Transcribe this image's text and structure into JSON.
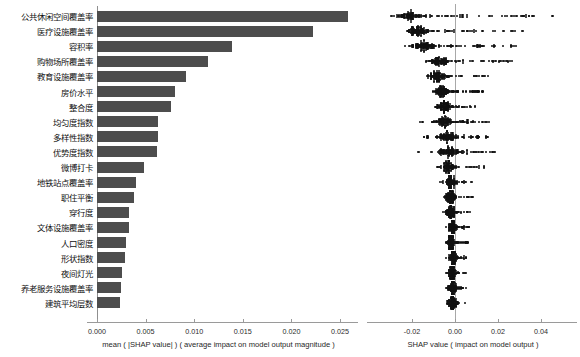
{
  "figure": {
    "type": "shap-summary",
    "background": "#ffffff",
    "bar_color": "#4d4d4d",
    "dot_color": "#111111",
    "axis_color": "#9a9a9a"
  },
  "chart_data": [
    {
      "type": "bar",
      "orientation": "horizontal",
      "title": "",
      "xlabel": "mean ( |SHAP value| ) ( average impact on model output magnitude )",
      "ylabel": "",
      "xlim": [
        0.0,
        0.027
      ],
      "xticks": [
        0.0,
        0.005,
        0.01,
        0.015,
        0.02,
        0.025
      ],
      "xticklabels": [
        "0.000",
        "0.005",
        "0.010",
        "0.015",
        "0.020",
        "0.025"
      ],
      "grid": false,
      "legend": "none",
      "categories": [
        "公共休闲空间覆盖率",
        "医疗设施覆盖率",
        "容积率",
        "购物场所覆盖率",
        "教育设施覆盖率",
        "房价水平",
        "整合度",
        "均匀度指数",
        "多样性指数",
        "优势度指数",
        "微博打卡",
        "地铁站点覆盖率",
        "职住平衡",
        "穿行度",
        "文体设施覆盖率",
        "人口密度",
        "形状指数",
        "夜间灯光",
        "养老服务设施覆盖率",
        "建筑平均层数"
      ],
      "values": [
        0.0258,
        0.0222,
        0.0139,
        0.0114,
        0.0092,
        0.008,
        0.0076,
        0.0063,
        0.0063,
        0.0062,
        0.0048,
        0.004,
        0.0038,
        0.0033,
        0.0033,
        0.003,
        0.0029,
        0.0026,
        0.0025,
        0.0024
      ]
    },
    {
      "type": "scatter",
      "subtype": "beeswarm",
      "title": "",
      "xlabel": "SHAP value ( impact on model output )",
      "ylabel": "",
      "xlim": [
        -0.031,
        0.056
      ],
      "xticks": [
        -0.02,
        0.0,
        0.02,
        0.04
      ],
      "xticklabels": [
        "-0.02",
        "0.00",
        "0.02",
        "0.04"
      ],
      "grid": false,
      "legend": "none",
      "zero_reference_line": 0.0,
      "categories": [
        "公共休闲空间覆盖率",
        "医疗设施覆盖率",
        "容积率",
        "购物场所覆盖率",
        "教育设施覆盖率",
        "房价水平",
        "整合度",
        "均匀度指数",
        "多样性指数",
        "优势度指数",
        "微博打卡",
        "地铁站点覆盖率",
        "职住平衡",
        "穿行度",
        "文体设施覆盖率",
        "人口密度",
        "形状指数",
        "夜间灯光",
        "养老服务设施覆盖率",
        "建筑平均层数"
      ],
      "series": [
        {
          "name": "公共休闲空间覆盖率",
          "cluster_center": -0.0205,
          "cluster_spread": 0.0055,
          "tail_max": 0.0465,
          "tail_min": -0.0275,
          "n_points": 150,
          "tail_density": 0.52
        },
        {
          "name": "医疗设施覆盖率",
          "cluster_center": -0.0175,
          "cluster_spread": 0.0042,
          "tail_max": 0.0365,
          "tail_min": -0.0235,
          "n_points": 145,
          "tail_density": 0.45
        },
        {
          "name": "容积率",
          "cluster_center": -0.0145,
          "cluster_spread": 0.005,
          "tail_max": 0.0305,
          "tail_min": -0.0215,
          "n_points": 140,
          "tail_density": 0.48
        },
        {
          "name": "购物场所覆盖率",
          "cluster_center": -0.0075,
          "cluster_spread": 0.0042,
          "tail_max": 0.0275,
          "tail_min": -0.0135,
          "n_points": 135,
          "tail_density": 0.44
        },
        {
          "name": "教育设施覆盖率",
          "cluster_center": -0.0082,
          "cluster_spread": 0.0032,
          "tail_max": 0.0155,
          "tail_min": -0.0135,
          "n_points": 130,
          "tail_density": 0.38
        },
        {
          "name": "房价水平",
          "cluster_center": -0.006,
          "cluster_spread": 0.0028,
          "tail_max": 0.0135,
          "tail_min": -0.0105,
          "n_points": 128,
          "tail_density": 0.36
        },
        {
          "name": "整合度",
          "cluster_center": -0.0052,
          "cluster_spread": 0.0026,
          "tail_max": 0.0125,
          "tail_min": -0.0092,
          "n_points": 126,
          "tail_density": 0.35
        },
        {
          "name": "均匀度指数",
          "cluster_center": -0.0048,
          "cluster_spread": 0.0034,
          "tail_max": 0.0175,
          "tail_min": -0.0195,
          "n_points": 132,
          "tail_density": 0.4
        },
        {
          "name": "多样性指数",
          "cluster_center": -0.004,
          "cluster_spread": 0.0034,
          "tail_max": 0.0165,
          "tail_min": -0.0185,
          "n_points": 130,
          "tail_density": 0.4
        },
        {
          "name": "优势度指数",
          "cluster_center": -0.0032,
          "cluster_spread": 0.0036,
          "tail_max": 0.0205,
          "tail_min": -0.0175,
          "n_points": 134,
          "tail_density": 0.42
        },
        {
          "name": "微博打卡",
          "cluster_center": -0.003,
          "cluster_spread": 0.0024,
          "tail_max": 0.0145,
          "tail_min": -0.0085,
          "n_points": 120,
          "tail_density": 0.33
        },
        {
          "name": "地铁站点覆盖率",
          "cluster_center": -0.0022,
          "cluster_spread": 0.002,
          "tail_max": 0.0095,
          "tail_min": -0.0072,
          "n_points": 118,
          "tail_density": 0.3
        },
        {
          "name": "职住平衡",
          "cluster_center": -0.0024,
          "cluster_spread": 0.002,
          "tail_max": 0.0085,
          "tail_min": -0.007,
          "n_points": 118,
          "tail_density": 0.29
        },
        {
          "name": "穿行度",
          "cluster_center": -0.002,
          "cluster_spread": 0.0019,
          "tail_max": 0.0078,
          "tail_min": -0.0065,
          "n_points": 116,
          "tail_density": 0.28
        },
        {
          "name": "文体设施覆盖率",
          "cluster_center": -0.0012,
          "cluster_spread": 0.0018,
          "tail_max": 0.0072,
          "tail_min": -0.0058,
          "n_points": 114,
          "tail_density": 0.27
        },
        {
          "name": "人口密度",
          "cluster_center": -0.0018,
          "cluster_spread": 0.0016,
          "tail_max": 0.0062,
          "tail_min": -0.0055,
          "n_points": 112,
          "tail_density": 0.25
        },
        {
          "name": "形状指数",
          "cluster_center": -0.0008,
          "cluster_spread": 0.0016,
          "tail_max": 0.0055,
          "tail_min": -0.005,
          "n_points": 112,
          "tail_density": 0.25
        },
        {
          "name": "夜间灯光",
          "cluster_center": -0.0014,
          "cluster_spread": 0.0015,
          "tail_max": 0.0052,
          "tail_min": -0.0048,
          "n_points": 110,
          "tail_density": 0.24
        },
        {
          "name": "养老服务设施覆盖率",
          "cluster_center": -0.0012,
          "cluster_spread": 0.0015,
          "tail_max": 0.005,
          "tail_min": -0.0046,
          "n_points": 110,
          "tail_density": 0.24
        },
        {
          "name": "建筑平均层数",
          "cluster_center": -0.0012,
          "cluster_spread": 0.0014,
          "tail_max": 0.0048,
          "tail_min": -0.0044,
          "n_points": 108,
          "tail_density": 0.23
        }
      ]
    }
  ]
}
